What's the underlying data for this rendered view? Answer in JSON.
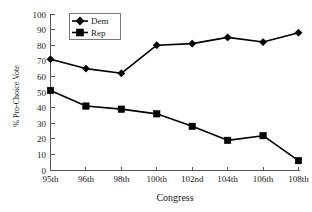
{
  "chart_data": {
    "type": "line",
    "title": "",
    "xlabel": "Congress",
    "ylabel": "% Pro-Choice Vote",
    "categories": [
      "95th",
      "96th",
      "98th",
      "100th",
      "102nd",
      "104th",
      "106th",
      "108th"
    ],
    "series": [
      {
        "name": "Dem",
        "marker": "diamond",
        "color": "#000000",
        "values": [
          71,
          65,
          62,
          80,
          81,
          85,
          82,
          88
        ]
      },
      {
        "name": "Rep",
        "marker": "square",
        "color": "#000000",
        "values": [
          51,
          41,
          39,
          36,
          28,
          19,
          22,
          6
        ]
      }
    ],
    "ylim": [
      0,
      100
    ],
    "ytick_step": 10,
    "yticks": [
      "0",
      "10",
      "20",
      "30",
      "40",
      "50",
      "60",
      "70",
      "80",
      "90",
      "100"
    ],
    "grid": false,
    "legend_position": "top-left-inside",
    "legend_entries": [
      "Dem",
      "Rep"
    ]
  }
}
